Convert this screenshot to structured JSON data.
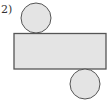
{
  "problem": {
    "label": "2)"
  },
  "figure": {
    "fill_color": "#e4e4e4",
    "stroke_color": "#555555",
    "top_circle": {
      "cx": 36,
      "cy": 18,
      "r": 15
    },
    "rectangle": {
      "x": 14,
      "y": 33,
      "width": 92,
      "height": 36
    },
    "bottom_circle": {
      "cx": 85,
      "cy": 84,
      "r": 15
    }
  }
}
